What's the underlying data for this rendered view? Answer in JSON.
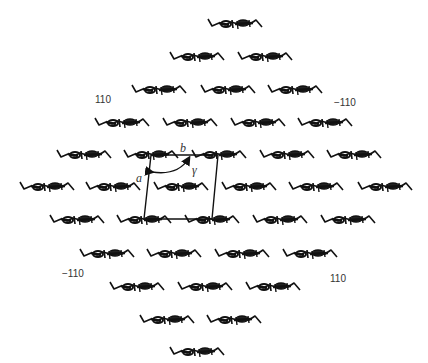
{
  "diagram": {
    "colors": {
      "molecule": "#111111",
      "cell": "#111111",
      "text": "#333333",
      "background": "#ffffff"
    },
    "molecule_width": 54,
    "rows": [
      {
        "y": 24,
        "x": [
          235
        ]
      },
      {
        "y": 57,
        "x": [
          197,
          265
        ]
      },
      {
        "y": 90,
        "x": [
          159,
          228,
          295
        ]
      },
      {
        "y": 123,
        "x": [
          122,
          190,
          258,
          325
        ]
      },
      {
        "y": 155,
        "x": [
          84,
          151,
          219,
          287,
          354
        ]
      },
      {
        "y": 187,
        "x": [
          47,
          113,
          181,
          249,
          316,
          385
        ]
      },
      {
        "y": 220,
        "x": [
          77,
          144,
          212,
          280,
          348
        ]
      },
      {
        "y": 254,
        "x": [
          107,
          174,
          242,
          310
        ]
      },
      {
        "y": 287,
        "x": [
          137,
          205,
          273
        ]
      },
      {
        "y": 320,
        "x": [
          167,
          234
        ]
      },
      {
        "y": 352,
        "x": [
          197
        ]
      }
    ],
    "unit_cell": {
      "corners": [
        [
          151,
          155
        ],
        [
          218,
          155
        ],
        [
          212,
          219
        ],
        [
          144,
          219
        ]
      ],
      "label_a": "a",
      "label_b": "b",
      "label_gamma": "γ"
    },
    "labels": {
      "top_left": "110",
      "top_right": "−110",
      "bottom_left": "−110",
      "bottom_right": "110"
    }
  }
}
